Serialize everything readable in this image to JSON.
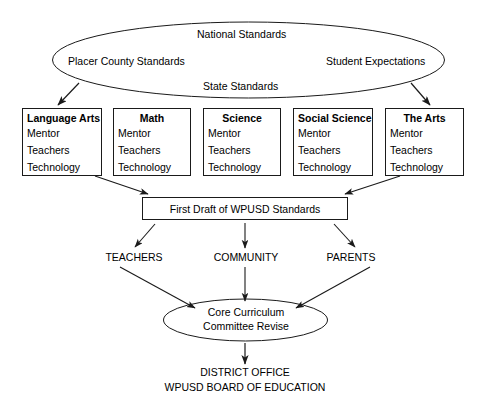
{
  "diagram": {
    "stroke_color": "#1a1a1a",
    "text_color": "#000000",
    "background": "#ffffff"
  },
  "top_ellipse": {
    "name": "standards-sources-ellipse",
    "labels": {
      "national": "National Standards",
      "placer_county": "Placer County Standards",
      "student_expectations": "Student Expectations",
      "state": "State Standards"
    }
  },
  "subject_boxes": [
    {
      "title": "Language Arts",
      "items": [
        "Mentor",
        "Teachers",
        "Technology"
      ]
    },
    {
      "title": "Math",
      "items": [
        "Mentor",
        "Teachers",
        "Technology"
      ]
    },
    {
      "title": "Science",
      "items": [
        "Mentor",
        "Teachers",
        "Technology"
      ]
    },
    {
      "title": "Social Science",
      "items": [
        "Mentor",
        "Teachers",
        "Technology"
      ]
    },
    {
      "title": "The Arts",
      "items": [
        "Mentor",
        "Teachers",
        "Technology"
      ]
    }
  ],
  "draft_box": {
    "label": "First Draft of WPUSD Standards"
  },
  "stakeholders": [
    {
      "label": "TEACHERS"
    },
    {
      "label": "COMMUNITY"
    },
    {
      "label": "PARENTS"
    }
  ],
  "review_ellipse": {
    "line1": "Core Curriculum",
    "line2": "Committee Revise"
  },
  "final_authority": {
    "line1": "DISTRICT OFFICE",
    "line2": "WPUSD BOARD OF EDUCATION"
  }
}
